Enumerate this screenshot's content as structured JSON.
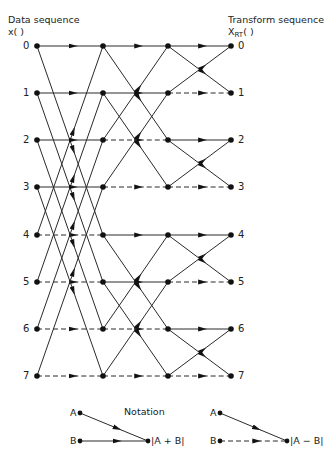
{
  "header": {
    "input_title": "Data sequence",
    "input_symbol": "x(   )",
    "output_title": "Transform sequence",
    "output_symbol_main": "X",
    "output_symbol_sub": "RT",
    "output_symbol_paren": "(   )"
  },
  "input_indices": [
    "0",
    "1",
    "2",
    "3",
    "4",
    "5",
    "6",
    "7"
  ],
  "output_indices": [
    "0",
    "1",
    "2",
    "3",
    "4",
    "5",
    "6",
    "7"
  ],
  "layout": {
    "columns_x": [
      37,
      103,
      168,
      231
    ],
    "rows_y": [
      46,
      93,
      140,
      187,
      235,
      282,
      329,
      376
    ],
    "line_color": "#2a2a2a",
    "node_color": "#111111"
  },
  "stages": [
    {
      "name": "stage-1",
      "span": 4
    },
    {
      "name": "stage-2",
      "span": 2
    },
    {
      "name": "stage-3",
      "span": 1
    }
  ],
  "notation": {
    "title": "Notation",
    "sum": {
      "a_label": "A",
      "b_label": "B",
      "result_label": "|A + B|",
      "b_style": "solid"
    },
    "diff": {
      "a_label": "A",
      "b_label": "B",
      "result_label": "|A − B|",
      "b_style": "dashed"
    }
  }
}
